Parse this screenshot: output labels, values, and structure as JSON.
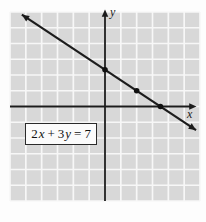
{
  "figure": {
    "axis_labels": {
      "x": "x",
      "y": "y"
    },
    "equation_box": {
      "term1_coef": "2",
      "term1_var": "x",
      "plus": "+",
      "term2_coef": "3",
      "term2_var": "y",
      "equals": "=",
      "constant": "7"
    },
    "colors": {
      "page_bg": "#fdfdfd",
      "grid_bg": "#d8d8d8",
      "grid_line": "#f7f7f7",
      "axis": "#1c1c1c",
      "line": "#1c1c1c",
      "point": "#111111",
      "box_bg": "#fbfbfb",
      "box_border": "#2a2a2a",
      "text": "#111111"
    }
  },
  "chart_data": {
    "type": "line",
    "equation": "2x + 3y = 7",
    "slope": -0.6666666667,
    "y_intercept": 2.3333333333,
    "x_intercept": 3.5,
    "xlabel": "x",
    "ylabel": "y",
    "xlim": [
      -6,
      6
    ],
    "ylim": [
      -6,
      6
    ],
    "grid": true,
    "grid_step": 1,
    "line_x_range": [
      -5.25,
      5.75
    ],
    "points": [
      {
        "x": 0,
        "y": 2.3333333333
      },
      {
        "x": 2,
        "y": 1
      },
      {
        "x": 3.5,
        "y": 0
      }
    ]
  }
}
